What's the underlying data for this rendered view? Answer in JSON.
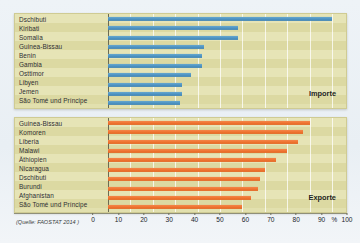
{
  "source_note": "(Quelle: FAOSTAT 2014 )",
  "axis": {
    "ticks": [
      0,
      10,
      20,
      30,
      40,
      50,
      60,
      70,
      80,
      90,
      100
    ],
    "percent_symbol": "%",
    "min": 0,
    "max": 100
  },
  "panels": [
    {
      "key": "imports",
      "series_label": "Importe",
      "color": "#ef7430"
    },
    {
      "key": "exports",
      "series_label": "Exporte",
      "color": "#4e93c2"
    }
  ],
  "chart_data": [
    {
      "type": "bar",
      "title": "Importe",
      "orientation": "horizontal",
      "xlabel": "%",
      "ylabel": "",
      "xlim": [
        0,
        100
      ],
      "grid": true,
      "legend_position": "inside-bottom-right",
      "color": "#4e93c2",
      "categories": [
        "Dschibuti",
        "Kiribati",
        "Somalia",
        "Guinea-Bissau",
        "Benin",
        "Gambia",
        "Osttimor",
        "Libyen",
        "Jemen",
        "São Tomé und Príncipe"
      ],
      "values": [
        100,
        58,
        58,
        43,
        42,
        42,
        37,
        33,
        33,
        32
      ]
    },
    {
      "type": "bar",
      "title": "Exporte",
      "orientation": "horizontal",
      "xlabel": "%",
      "ylabel": "",
      "xlim": [
        0,
        100
      ],
      "grid": true,
      "legend_position": "inside-bottom-right",
      "color": "#ef7430",
      "categories": [
        "Guinea-Bissau",
        "Komoren",
        "Liberia",
        "Malawi",
        "Äthiopien",
        "Nicaragua",
        "Dschibuti",
        "Burundi",
        "Afghanistan",
        "São Tomé und Príncipe"
      ],
      "values": [
        90,
        87,
        85,
        80,
        75,
        70,
        68,
        67,
        64,
        60
      ]
    }
  ]
}
